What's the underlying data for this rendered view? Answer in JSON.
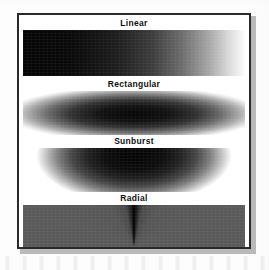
{
  "figure": {
    "panel_border_color": "#2a2a2a",
    "panel_background": "#ffffff",
    "page_background": "#fdfdfd"
  },
  "swatches": [
    {
      "label": "Linear",
      "gradient_type": "linear",
      "direction": "left-to-right",
      "from_color": "#000000",
      "to_color": "#ffffff"
    },
    {
      "label": "Rectangular",
      "gradient_type": "rectangular",
      "direction": "center-outward",
      "from_color": "#000000",
      "to_color": "#ffffff"
    },
    {
      "label": "Sunburst",
      "gradient_type": "sunburst",
      "direction": "top-center-outward",
      "from_color": "#000000",
      "to_color": "#ffffff"
    },
    {
      "label": "Radial",
      "gradient_type": "radial",
      "direction": "sweep-around-bottom-center",
      "from_color": "#000000",
      "to_color": "#ffffff"
    }
  ]
}
